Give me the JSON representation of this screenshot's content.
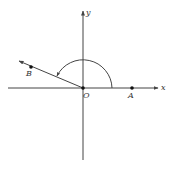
{
  "diagram": {
    "type": "coordinate-angle-figure",
    "colors": {
      "stroke": "#444444",
      "point": "#111111",
      "background": "#ffffff"
    },
    "axes": {
      "x_label": "x",
      "y_label": "y"
    },
    "points": {
      "origin": "O",
      "a": "A",
      "b": "B"
    },
    "elements": [
      "x-axis with arrow",
      "y-axis with arrow",
      "ray OB with arrow",
      "point A on positive x-axis",
      "point B on ray",
      "arc with arrow indicating rotation angle from OA to OB"
    ]
  }
}
